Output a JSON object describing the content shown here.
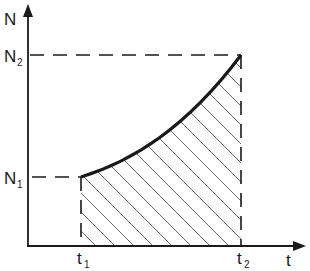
{
  "diagram": {
    "y_axis_label": "N",
    "x_axis_label": "t",
    "y_ticks": [
      {
        "main": "N",
        "sub": "2",
        "y": 55
      },
      {
        "main": "N",
        "sub": "1",
        "y": 177
      }
    ],
    "x_ticks": [
      {
        "main": "t",
        "sub": "1",
        "x": 81
      },
      {
        "main": "t",
        "sub": "2",
        "x": 241
      }
    ],
    "curve": "exponential growth from (t1, N1) to (t2, N2)",
    "shaded_region": "area under curve between t1 and t2 (hatched)",
    "colors": {
      "line": "#1a1a1a",
      "hatch": "#555555",
      "background": "#ffffff"
    }
  }
}
